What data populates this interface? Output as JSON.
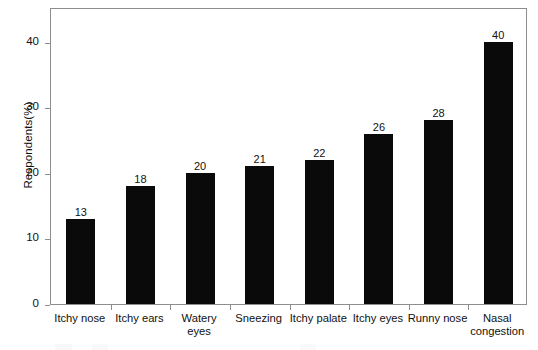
{
  "chart_data": {
    "type": "bar",
    "title": "",
    "subtitle": "",
    "xlabel": "",
    "ylabel": "Respondents(%)",
    "categories": [
      "Itchy nose",
      "Itchy ears",
      "Watery eyes",
      "Sneezing",
      "Itchy palate",
      "Itchy eyes",
      "Runny nose",
      "Nasal congestion"
    ],
    "category_lines": [
      [
        "Itchy nose"
      ],
      [
        "Itchy ears"
      ],
      [
        "Watery",
        "eyes"
      ],
      [
        "Sneezing"
      ],
      [
        "Itchy palate"
      ],
      [
        "Itchy eyes"
      ],
      [
        "Runny nose"
      ],
      [
        "Nasal",
        "congestion"
      ]
    ],
    "values": [
      13,
      18,
      20,
      21,
      22,
      26,
      28,
      40
    ],
    "value_labels": [
      "13",
      "18",
      "20",
      "21",
      "22",
      "26",
      "28",
      "40"
    ],
    "ylim": [
      0,
      45.3
    ],
    "yticks": [
      0,
      10,
      20,
      30,
      40
    ],
    "ytick_labels": [
      "0",
      "10",
      "20",
      "30",
      "40"
    ],
    "grid": false,
    "legend": null,
    "bar_color": "#0a0a0a",
    "axis_color": "#8d8d8d",
    "background_color": "#ffffff"
  }
}
